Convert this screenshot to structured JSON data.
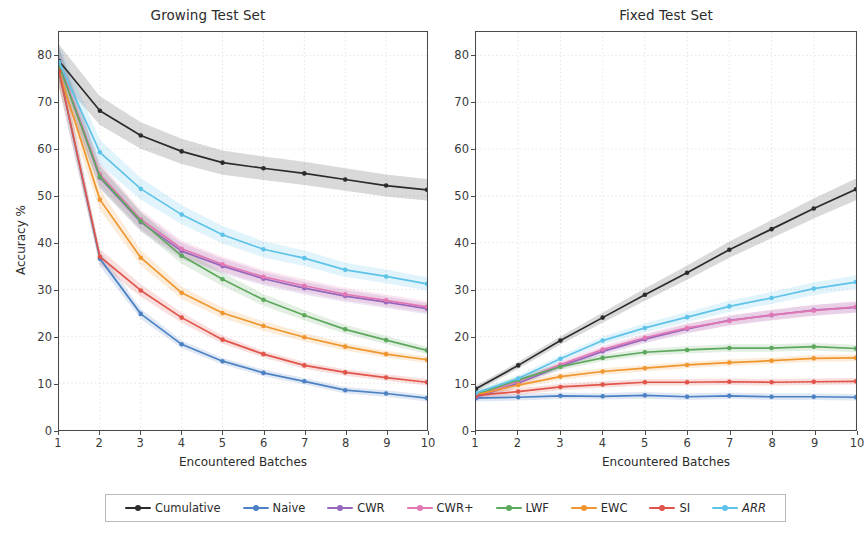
{
  "figure": {
    "width": 866,
    "height": 551,
    "background": "#ffffff"
  },
  "axis": {
    "ylabel": "Accuracy %",
    "xlabel": "Encountered Batches",
    "yticks": [
      0,
      10,
      20,
      30,
      40,
      50,
      60,
      70,
      80
    ],
    "xticks": [
      1,
      2,
      3,
      4,
      5,
      6,
      7,
      8,
      9,
      10
    ],
    "ylim": [
      0,
      85
    ],
    "xlim": [
      1,
      10
    ],
    "grid": true,
    "grid_color": "#d8d8d8"
  },
  "legend": {
    "position": "below-center",
    "entries": [
      {
        "label": "Cumulative",
        "color": "#2b2b2b",
        "italic": false
      },
      {
        "label": "Naive",
        "color": "#4c82c3",
        "italic": false
      },
      {
        "label": "CWR",
        "color": "#9467bd",
        "italic": false
      },
      {
        "label": "CWR+",
        "color": "#e377b4",
        "italic": false
      },
      {
        "label": "LWF",
        "color": "#5ca85c",
        "italic": false
      },
      {
        "label": "EWC",
        "color": "#f0962e",
        "italic": false
      },
      {
        "label": "SI",
        "color": "#e0544a",
        "italic": false
      },
      {
        "label": "ARR",
        "color": "#5ec3e8",
        "italic": true
      }
    ]
  },
  "chart_data": [
    {
      "type": "line",
      "title": "Growing Test Set",
      "xlabel": "Encountered Batches",
      "ylabel": "Accuracy %",
      "xlim": [
        1,
        10
      ],
      "ylim": [
        0,
        85
      ],
      "grid": true,
      "x": [
        1,
        2,
        3,
        4,
        5,
        6,
        7,
        8,
        9,
        10
      ],
      "series": [
        {
          "name": "Cumulative",
          "color": "#2b2b2b",
          "values": [
            78.8,
            68.2,
            62.9,
            59.5,
            57.1,
            55.9,
            54.8,
            53.5,
            52.2,
            51.3
          ]
        },
        {
          "name": "Naive",
          "color": "#4c82c3",
          "values": [
            76.6,
            36.6,
            24.8,
            18.3,
            14.7,
            12.2,
            10.4,
            8.5,
            7.8,
            6.8
          ]
        },
        {
          "name": "CWR",
          "color": "#9467bd",
          "values": [
            78.2,
            53.9,
            44.4,
            38.2,
            35.0,
            32.3,
            30.3,
            28.6,
            27.3,
            25.9
          ]
        },
        {
          "name": "CWR+",
          "color": "#e377b4",
          "values": [
            78.4,
            54.6,
            45.0,
            38.7,
            35.4,
            32.7,
            30.8,
            29.0,
            27.7,
            26.3
          ]
        },
        {
          "name": "LWF",
          "color": "#5ca85c",
          "values": [
            78.0,
            54.1,
            44.6,
            37.2,
            32.2,
            27.8,
            24.5,
            21.5,
            19.2,
            17.0
          ]
        },
        {
          "name": "EWC",
          "color": "#f0962e",
          "values": [
            76.5,
            49.2,
            36.8,
            29.3,
            25.0,
            22.2,
            19.8,
            17.8,
            16.2,
            15.0
          ]
        },
        {
          "name": "SI",
          "color": "#e0544a",
          "values": [
            76.6,
            37.0,
            29.8,
            24.0,
            19.3,
            16.2,
            13.8,
            12.3,
            11.2,
            10.2
          ]
        },
        {
          "name": "ARR",
          "color": "#5ec3e8",
          "values": [
            78.6,
            59.3,
            51.5,
            46.0,
            41.7,
            38.6,
            36.7,
            34.2,
            32.8,
            31.2
          ]
        }
      ]
    },
    {
      "type": "line",
      "title": "Fixed Test Set",
      "xlabel": "Encountered Batches",
      "ylabel": "Accuracy %",
      "xlim": [
        1,
        10
      ],
      "ylim": [
        0,
        85
      ],
      "grid": true,
      "x": [
        1,
        2,
        3,
        4,
        5,
        6,
        7,
        8,
        9,
        10
      ],
      "series": [
        {
          "name": "Cumulative",
          "color": "#2b2b2b",
          "values": [
            8.8,
            13.8,
            19.1,
            24.0,
            28.9,
            33.6,
            38.5,
            42.9,
            47.3,
            51.4
          ]
        },
        {
          "name": "Naive",
          "color": "#4c82c3",
          "values": [
            6.8,
            7.0,
            7.3,
            7.2,
            7.4,
            7.1,
            7.3,
            7.1,
            7.1,
            7.0
          ]
        },
        {
          "name": "CWR",
          "color": "#9467bd",
          "values": [
            7.0,
            10.0,
            13.6,
            16.8,
            19.4,
            21.6,
            23.4,
            24.5,
            25.6,
            26.2
          ]
        },
        {
          "name": "CWR+",
          "color": "#e377b4",
          "values": [
            7.4,
            10.4,
            14.0,
            17.2,
            19.7,
            21.8,
            23.3,
            24.6,
            25.5,
            26.3
          ]
        },
        {
          "name": "LWF",
          "color": "#5ca85c",
          "values": [
            7.6,
            10.7,
            13.5,
            15.4,
            16.6,
            17.1,
            17.5,
            17.5,
            17.8,
            17.4
          ]
        },
        {
          "name": "EWC",
          "color": "#f0962e",
          "values": [
            7.5,
            9.6,
            11.4,
            12.5,
            13.2,
            13.9,
            14.4,
            14.8,
            15.3,
            15.4
          ]
        },
        {
          "name": "SI",
          "color": "#e0544a",
          "values": [
            7.4,
            8.2,
            9.2,
            9.7,
            10.2,
            10.2,
            10.3,
            10.2,
            10.3,
            10.4
          ]
        },
        {
          "name": "ARR",
          "color": "#5ec3e8",
          "values": [
            7.9,
            11.0,
            15.2,
            19.1,
            21.8,
            24.1,
            26.4,
            28.2,
            30.2,
            31.6
          ]
        }
      ]
    }
  ]
}
